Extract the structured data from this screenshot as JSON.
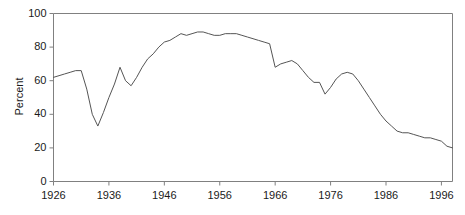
{
  "chart_data": {
    "type": "line",
    "title": "",
    "subtitle": "",
    "xlabel": "",
    "ylabel": "Percent",
    "xlim": [
      1926,
      1998
    ],
    "ylim": [
      0,
      100
    ],
    "grid": false,
    "legend": null,
    "legend_position": "none",
    "x_ticks": [
      1926,
      1936,
      1946,
      1956,
      1966,
      1976,
      1986,
      1996
    ],
    "x_tick_labels": [
      "1926",
      "1936",
      "1946",
      "1956",
      "1966",
      "1976",
      "1986",
      "1996"
    ],
    "y_ticks": [
      0,
      20,
      40,
      60,
      80,
      100
    ],
    "y_tick_labels": [
      "0",
      "20",
      "40",
      "60",
      "80",
      "100"
    ],
    "line_color": "#555555",
    "axis_color": "#808080",
    "series": [
      {
        "name": "Percent",
        "x": [
          1926,
          1927,
          1928,
          1929,
          1930,
          1931,
          1932,
          1933,
          1934,
          1935,
          1936,
          1937,
          1938,
          1939,
          1940,
          1941,
          1942,
          1943,
          1944,
          1945,
          1946,
          1947,
          1948,
          1949,
          1950,
          1951,
          1952,
          1953,
          1954,
          1955,
          1956,
          1957,
          1958,
          1959,
          1960,
          1961,
          1962,
          1963,
          1964,
          1965,
          1966,
          1967,
          1968,
          1969,
          1970,
          1971,
          1972,
          1973,
          1974,
          1975,
          1976,
          1977,
          1978,
          1979,
          1980,
          1981,
          1982,
          1983,
          1984,
          1985,
          1986,
          1987,
          1988,
          1989,
          1990,
          1991,
          1992,
          1993,
          1994,
          1995,
          1996,
          1997,
          1998
        ],
        "values": [
          62,
          63,
          64,
          65,
          66,
          66,
          55,
          40,
          33,
          41,
          50,
          58,
          68,
          60,
          57,
          62,
          68,
          73,
          76,
          80,
          83,
          84,
          86,
          88,
          87,
          88,
          89,
          89,
          88,
          87,
          87,
          88,
          88,
          88,
          87,
          86,
          85,
          84,
          83,
          82,
          68,
          70,
          71,
          72,
          70,
          66,
          62,
          59,
          59,
          52,
          56,
          61,
          64,
          65,
          64,
          60,
          55,
          50,
          45,
          40,
          36,
          33,
          30,
          29,
          29,
          28,
          27,
          26,
          26,
          25,
          24,
          21,
          20
        ]
      }
    ]
  },
  "axes": {
    "y_title": "Percent"
  }
}
